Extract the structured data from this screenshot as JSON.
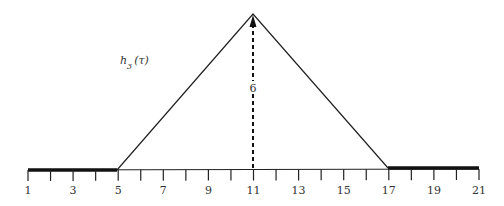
{
  "diagram": {
    "function_label": "h",
    "function_subscript": "3",
    "function_arg": "(τ)",
    "height_label": "6",
    "axis": {
      "min": 1,
      "max": 21,
      "tick_labels": [
        "1",
        "3",
        "5",
        "7",
        "9",
        "11",
        "13",
        "15",
        "17",
        "19",
        "21"
      ]
    },
    "shape": {
      "type": "triangle",
      "start": 5,
      "peak": 11,
      "end": 17,
      "peak_height": 6
    },
    "bold_segments": [
      [
        1,
        5
      ],
      [
        17,
        21
      ]
    ],
    "line_color": "#222222"
  }
}
